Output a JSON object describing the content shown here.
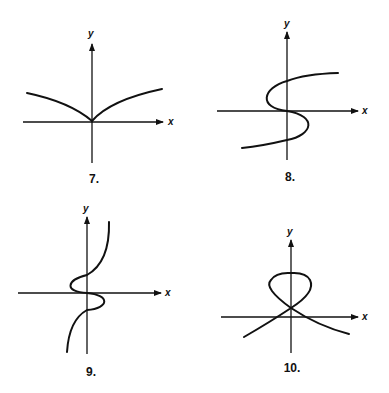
{
  "figures": [
    {
      "number_label": "7.",
      "x_axis_label": "x",
      "y_axis_label": "y",
      "description": "cusp curve, symmetric about y-axis, like y = |x|^(2/3)"
    },
    {
      "number_label": "8.",
      "x_axis_label": "x",
      "y_axis_label": "y",
      "description": "S-shaped curve, x as cubic function of y"
    },
    {
      "number_label": "9.",
      "x_axis_label": "x",
      "y_axis_label": "y",
      "description": "curve with wiggle near origin, steep growth at ends"
    },
    {
      "number_label": "10.",
      "x_axis_label": "x",
      "y_axis_label": "y",
      "description": "loop above origin with branches crossing below"
    }
  ],
  "colors": {
    "ink": "#111111",
    "background": "#ffffff"
  }
}
